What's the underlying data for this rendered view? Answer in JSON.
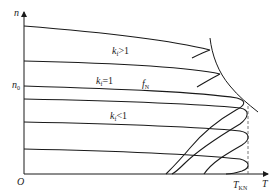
{
  "diagram": {
    "axes": {
      "y_label": "n",
      "x_label": "T",
      "origin_label": "O",
      "y_marker": {
        "main": "n",
        "sub": "0"
      },
      "x_marker": {
        "main": "T",
        "sub": "KN"
      }
    },
    "annotations": [
      {
        "id": "kf-gt-1",
        "main": "k",
        "sub": "f",
        "rel": ">1"
      },
      {
        "id": "kf-eq-1",
        "main": "k",
        "sub": "f",
        "rel": "=1"
      },
      {
        "id": "fN",
        "main": "f",
        "sub": "N"
      },
      {
        "id": "kf-lt-1",
        "main": "k",
        "sub": "f",
        "rel": "<1"
      }
    ],
    "curves": [
      {
        "name": "curve-kf-gt-1-high",
        "start_y": 26
      },
      {
        "name": "curve-kf-gt-1-low",
        "start_y": 61
      },
      {
        "name": "curve-fN",
        "start_y": 86
      },
      {
        "name": "curve-kf-lt-1-a",
        "start_y": 99
      },
      {
        "name": "curve-kf-lt-1-b",
        "start_y": 122
      },
      {
        "name": "curve-kf-lt-1-c",
        "start_y": 149
      }
    ],
    "colors": {
      "line": "#1a1a1a",
      "dashed": "#555555",
      "text": "#222222"
    }
  }
}
